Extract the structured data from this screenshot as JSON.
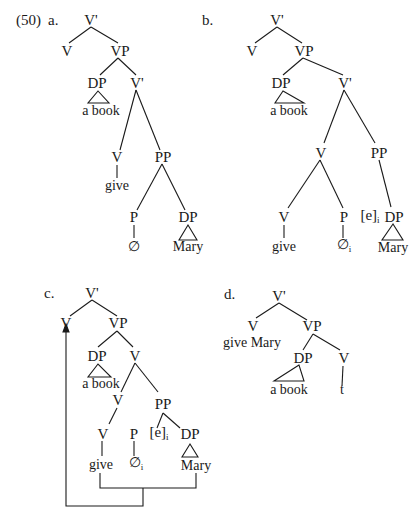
{
  "example_number": "(50)",
  "trees": [
    {
      "id": "a",
      "label": "a.",
      "nodes": {
        "root": "V'",
        "v_head": "V",
        "vp": "VP",
        "dp": "DP",
        "dp_text": "a book",
        "vbar": "V'",
        "v": "V",
        "v_word": "give",
        "pp": "PP",
        "p": "P",
        "p_word": "∅",
        "dp2": "DP",
        "dp2_text": "Mary"
      }
    },
    {
      "id": "b",
      "label": "b.",
      "nodes": {
        "root": "V'",
        "v_head": "V",
        "vp": "VP",
        "dp": "DP",
        "dp_text": "a book",
        "vbar": "V'",
        "v_complex": "V",
        "pp": "PP",
        "v": "V",
        "v_word": "give",
        "p": "P",
        "p_word": "∅",
        "p_index": "i",
        "empty": "[e]",
        "empty_index": "i",
        "dp2": "DP",
        "dp2_text": "Mary"
      }
    },
    {
      "id": "c",
      "label": "c.",
      "nodes": {
        "root": "V'",
        "v_head": "V",
        "vp": "VP",
        "dp": "DP",
        "dp_text": "a book",
        "v_mid": "V",
        "v_low": "V",
        "pp": "PP",
        "v": "V",
        "v_word": "give",
        "p": "P",
        "p_word": "∅",
        "p_index": "i",
        "empty": "[e]",
        "empty_index": "i",
        "dp2": "DP",
        "dp2_text": "Mary"
      },
      "movement_arrow": "give + Mary raised to V head"
    },
    {
      "id": "d",
      "label": "d.",
      "nodes": {
        "root": "V'",
        "v_head": "V",
        "v_word": "give Mary",
        "vp": "VP",
        "dp": "DP",
        "dp_text": "a book",
        "v": "V",
        "trace": "t"
      }
    }
  ]
}
